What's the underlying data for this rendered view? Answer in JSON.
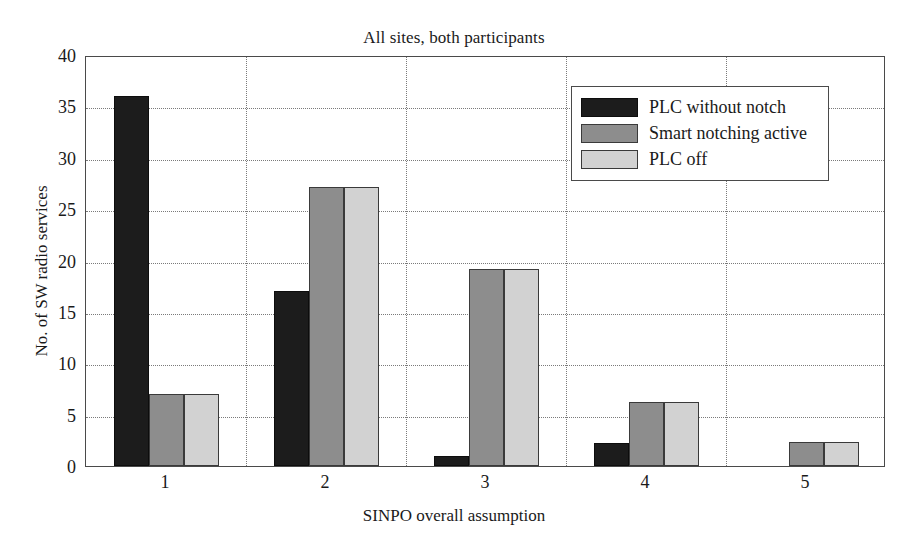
{
  "chart_data": {
    "type": "bar",
    "title": "All sites, both participants",
    "xlabel": "SINPO overall assumption",
    "ylabel": "No. of SW radio services",
    "categories": [
      "1",
      "2",
      "3",
      "4",
      "5"
    ],
    "series": [
      {
        "name": "PLC without notch",
        "color": "#1c1c1c",
        "values": [
          36,
          17,
          1,
          2.2,
          0
        ]
      },
      {
        "name": "Smart notching active",
        "color": "#8d8d8d",
        "values": [
          7,
          27.2,
          19.2,
          6.2,
          2.3
        ]
      },
      {
        "name": "PLC off",
        "color": "#d2d2d2",
        "values": [
          7,
          27.2,
          19.2,
          6.2,
          2.3
        ]
      }
    ],
    "ylim": [
      0,
      40
    ],
    "yticks": [
      0,
      5,
      10,
      15,
      20,
      25,
      30,
      35,
      40
    ],
    "ytick_labels": [
      "0",
      "5",
      "10",
      "15",
      "20",
      "25",
      "30",
      "35",
      "40"
    ],
    "xtick_labels": [
      "1",
      "2",
      "3",
      "4",
      "5"
    ],
    "grid": true,
    "legend_position": "upper right"
  }
}
